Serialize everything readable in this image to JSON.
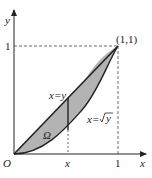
{
  "figure": {
    "axes": {
      "x_label": "x",
      "y_label": "y",
      "origin_label": "O"
    },
    "ticks": {
      "x_one": "1",
      "y_one": "1",
      "x_var": "x"
    },
    "point_label": "(1,1)",
    "curve_labels": {
      "line": "x=y",
      "curve": "x=",
      "curve_sqrt_arg": "y"
    },
    "region_label": "Ω",
    "colors": {
      "fill": "#b3b3b3",
      "stroke": "#222222"
    }
  }
}
